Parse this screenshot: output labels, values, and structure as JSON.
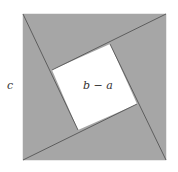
{
  "diagram": {
    "title": "",
    "type": "geometric proof figure",
    "colors": {
      "triangle_fill": "#a6a6a6",
      "inner_square_fill": "#ffffff",
      "line_color": "#555555",
      "label_color": "#333333"
    },
    "outer_square": {
      "x": 23,
      "y": 14,
      "width": 143,
      "height": 146
    },
    "inner_square": {
      "vertices": [
        [
          110,
          44
        ],
        [
          137,
          104
        ],
        [
          78,
          130
        ],
        [
          52,
          70
        ]
      ]
    },
    "lines": [
      {
        "from": [
          23,
          14
        ],
        "to": [
          78,
          130
        ]
      },
      {
        "from": [
          166,
          14
        ],
        "to": [
          52,
          70
        ]
      },
      {
        "from": [
          166,
          160
        ],
        "to": [
          110,
          44
        ]
      },
      {
        "from": [
          23,
          160
        ],
        "to": [
          137,
          104
        ]
      }
    ],
    "labels": {
      "side": "c",
      "inner": "b − a"
    }
  }
}
